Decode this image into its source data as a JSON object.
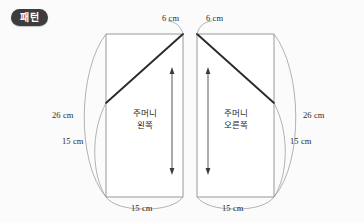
{
  "badge": {
    "label": "패턴"
  },
  "pieces": [
    {
      "id": "pocket-left",
      "name_line1": "주머니",
      "name_line2": "왼쪽",
      "grainline": "double-headed-arrow",
      "dimensions": {
        "top_diagonal": "6 cm",
        "side_long": "26 cm",
        "side_short": "15 cm",
        "bottom": "15 cm"
      }
    },
    {
      "id": "pocket-right",
      "name_line1": "주머니",
      "name_line2": "오른쪽",
      "grainline": "double-headed-arrow",
      "dimensions": {
        "top_diagonal": "6 cm",
        "side_long": "26 cm",
        "side_short": "15 cm",
        "bottom": "15 cm"
      }
    }
  ],
  "colors": {
    "background": "#fbfbfb",
    "outline": "#8c8c8c",
    "cutline": "#2b2b2b",
    "leader": "#9a9a9a",
    "badge_bg": "#3d3d3f",
    "badge_text": "#ffffff",
    "text": "#262626"
  }
}
